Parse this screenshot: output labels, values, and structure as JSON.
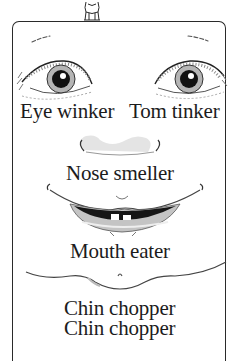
{
  "rhyme": {
    "lines": [
      {
        "id": "eye-left",
        "text": "Eye winker"
      },
      {
        "id": "eye-right",
        "text": "Tom tinker"
      },
      {
        "id": "nose",
        "text": "Nose smeller"
      },
      {
        "id": "mouth",
        "text": "Mouth eater"
      },
      {
        "id": "chin-1",
        "text": "Chin chopper"
      },
      {
        "id": "chin-2",
        "text": "Chin chopper"
      }
    ]
  },
  "illustration": {
    "features": [
      "figure-on-top",
      "eyebrows",
      "eyes",
      "nose",
      "mouth",
      "chin"
    ],
    "colors": {
      "ink": "#1c1c1c",
      "background": "#ffffff",
      "shade": "#c8c8c8",
      "lip": "#bdbdbd"
    }
  }
}
